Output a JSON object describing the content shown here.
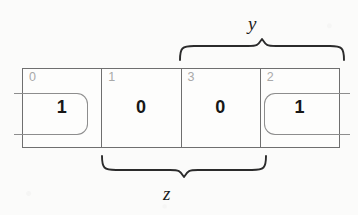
{
  "diagram": {
    "type": "karnaugh-map",
    "title": "",
    "cells": [
      {
        "index": "0",
        "value": "1"
      },
      {
        "index": "1",
        "value": "0"
      },
      {
        "index": "3",
        "value": "0"
      },
      {
        "index": "2",
        "value": "1"
      }
    ],
    "groups": [
      {
        "name": "wrap-around-group",
        "cells": [
          "0",
          "2"
        ],
        "values": [
          "1",
          "1"
        ],
        "style": "rounded-rectangle",
        "wraps": true,
        "color": "#8d8d8d"
      }
    ],
    "braces": [
      {
        "name": "y",
        "label": "y",
        "position": "top",
        "spans_cells": [
          "3",
          "2"
        ]
      },
      {
        "name": "z",
        "label": "z",
        "position": "bottom",
        "spans_cells": [
          "1",
          "3"
        ]
      }
    ],
    "colors": {
      "grid_line": "#6f6f6f",
      "cell_index": "#a9a9a9",
      "cell_value": "#171717",
      "group_ring": "#8d8d8d",
      "brace": "#2b2b2b",
      "background": "#fbfbfa"
    }
  }
}
